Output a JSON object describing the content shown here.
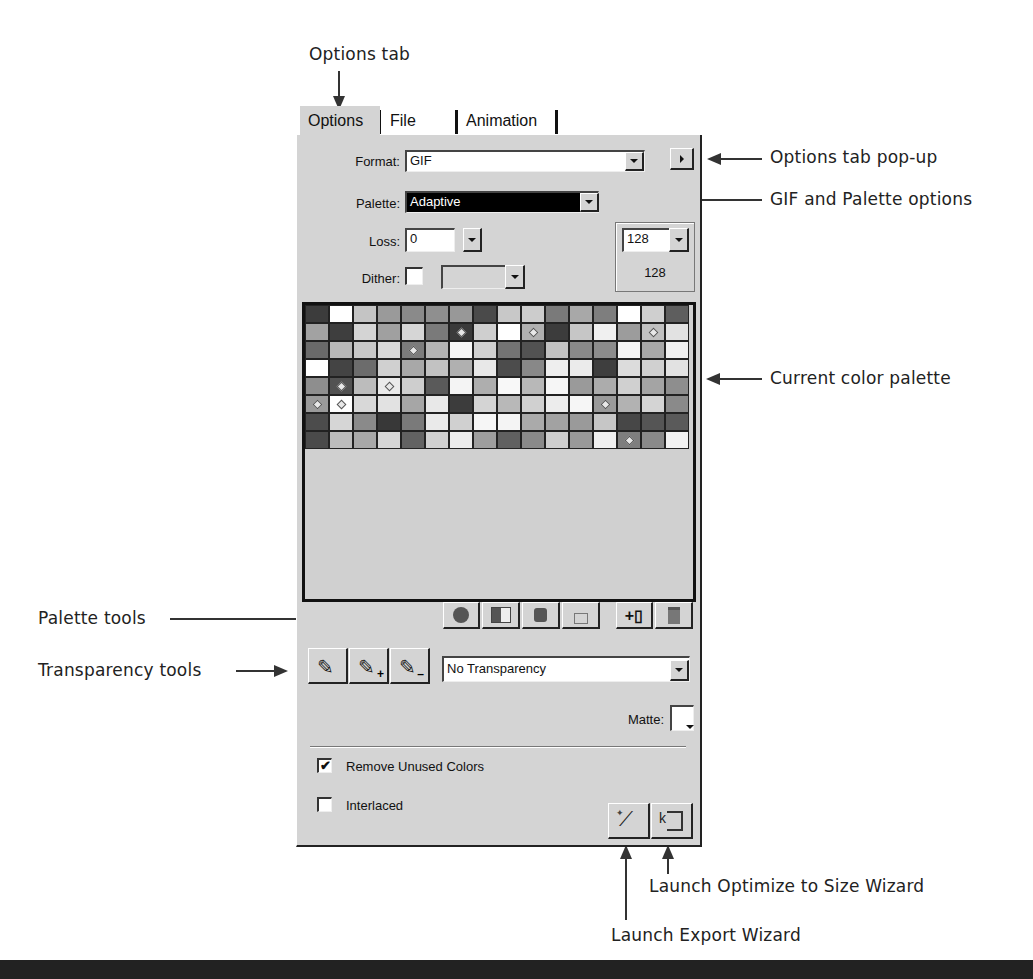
{
  "callouts": {
    "options_tab": "Options tab",
    "options_popup": "Options tab pop-up",
    "gif_palette": "GIF and Palette options",
    "current_palette": "Current color palette",
    "palette_tools": "Palette tools",
    "transparency_tools": "Transparency tools",
    "optimize_wizard": "Launch Optimize to Size Wizard",
    "export_wizard": "Launch Export Wizard"
  },
  "tabs": [
    {
      "label": "Options",
      "active": true
    },
    {
      "label": "File",
      "active": false
    },
    {
      "label": "Animation",
      "active": false
    }
  ],
  "options": {
    "format_label": "Format:",
    "format_value": "GIF",
    "palette_label": "Palette:",
    "palette_value": "Adaptive",
    "loss_label": "Loss:",
    "loss_value": "0",
    "dither_label": "Dither:",
    "dither_checked": false,
    "dither_value": "",
    "colors_value": "128",
    "colors_count": "128"
  },
  "palette": {
    "columns": 16,
    "rows": [
      [
        "#3c3c3c",
        "#ffffff",
        "#c4c4c4",
        "#9a9a9a",
        "#8a8a8a",
        "#8f8f8f",
        "#989898",
        "#4a4a4a",
        "#c8c8c8",
        "#cccccc",
        "#7a7a7a",
        "#a8a8a8",
        "#7e7e7e",
        "#ffffff",
        "#cfcfcf",
        "#5e5e5e"
      ],
      [
        "#a2a2a2",
        "#3e3e3e",
        "#d4d4d4",
        "#a0a0a0",
        "#d6d6d6",
        "#7a7a7a",
        "#3a3a3a",
        "#cfcfcf",
        "#ffffff",
        "#b0b0b0",
        "#3c3c3c",
        "#c6c6c6",
        "#f0f0f0",
        "#9c9c9c",
        "#c0c0c0",
        "#e2e2e2"
      ],
      [
        "#6a6a6a",
        "#b8b8b8",
        "#c8c8c8",
        "#d8d8d8",
        "#7c7c7c",
        "#b4b4b4",
        "#f6f6f6",
        "#d0d0d0",
        "#747474",
        "#525252",
        "#c2c2c2",
        "#8a8a8a",
        "#8c8c8c",
        "#f4f4f4",
        "#a8a8a8",
        "#f0f0f0"
      ],
      [
        "#ffffff",
        "#444444",
        "#6c6c6c",
        "#d0d0d0",
        "#a8a8a8",
        "#c2c2c2",
        "#b0b0b0",
        "#e8e8e8",
        "#4c4c4c",
        "#888888",
        "#eeeeee",
        "#ebebeb",
        "#3e3e3e",
        "#dcdcdc",
        "#d0d0d0",
        "#e2e2e2"
      ],
      [
        "#8e8e8e",
        "#525252",
        "#bcbcbc",
        "#eaeaea",
        "#cecece",
        "#5a5a5a",
        "#f4f4f4",
        "#aeaeae",
        "#f8f8f8",
        "#b8b8b8",
        "#f6f6f6",
        "#9a9a9a",
        "#acacac",
        "#d0d0d0",
        "#a4a4a4",
        "#8e8e8e"
      ],
      [
        "#9a9a9a",
        "#ffffff",
        "#d8d8d8",
        "#e2e2e2",
        "#a6a6a6",
        "#e8e8e8",
        "#3c3c3c",
        "#d4d4d4",
        "#b8b8b8",
        "#d0d0d0",
        "#ececec",
        "#f6f6f6",
        "#9a9a9a",
        "#b2b2b2",
        "#d4d4d4",
        "#8a8a8a"
      ],
      [
        "#4c4c4c",
        "#d6d6d6",
        "#8a8a8a",
        "#383838",
        "#7a7a7a",
        "#eaeaea",
        "#d0d0d0",
        "#f6f6f6",
        "#f4f4f4",
        "#aaaaaa",
        "#a2a2a2",
        "#9a9a9a",
        "#c6c6c6",
        "#474747",
        "#555555",
        "#5a5a5a"
      ],
      [
        "#4a4a4a",
        "#bcbcbc",
        "#a8a8a8",
        "#d6d6d6",
        "#626262",
        "#d0d0d0",
        "#ececec",
        "#9e9e9e",
        "#606060",
        "#8a8a8a",
        "#cecece",
        "#999999",
        "#f0f0f0",
        "#7e7e7e",
        "#8a8a8a",
        "#f2f2f2"
      ]
    ],
    "marked": [
      [
        1,
        6
      ],
      [
        1,
        9
      ],
      [
        1,
        14
      ],
      [
        2,
        4
      ],
      [
        4,
        1
      ],
      [
        4,
        3
      ],
      [
        5,
        0
      ],
      [
        5,
        1
      ],
      [
        5,
        12
      ],
      [
        7,
        13
      ]
    ]
  },
  "palette_tools": [
    {
      "name": "edit-color",
      "glyph": "●"
    },
    {
      "name": "transparent-color",
      "glyph": "▦"
    },
    {
      "name": "snap-to-web-safe",
      "glyph": "◆"
    },
    {
      "name": "lock-color",
      "glyph": "🔒"
    },
    {
      "name": "add-color",
      "glyph": "+"
    },
    {
      "name": "delete-color",
      "glyph": "🗑"
    }
  ],
  "transparency": {
    "value": "No Transparency",
    "matte_label": "Matte:"
  },
  "checkboxes": {
    "remove_unused_label": "Remove Unused Colors",
    "remove_unused_checked": true,
    "remove_unused_mark": "✔",
    "interlaced_label": "Interlaced",
    "interlaced_checked": false
  },
  "colors": {
    "panel_bg": "#d4d4d4",
    "selected_field_bg": "#000000",
    "selected_field_fg": "#ffffff"
  }
}
